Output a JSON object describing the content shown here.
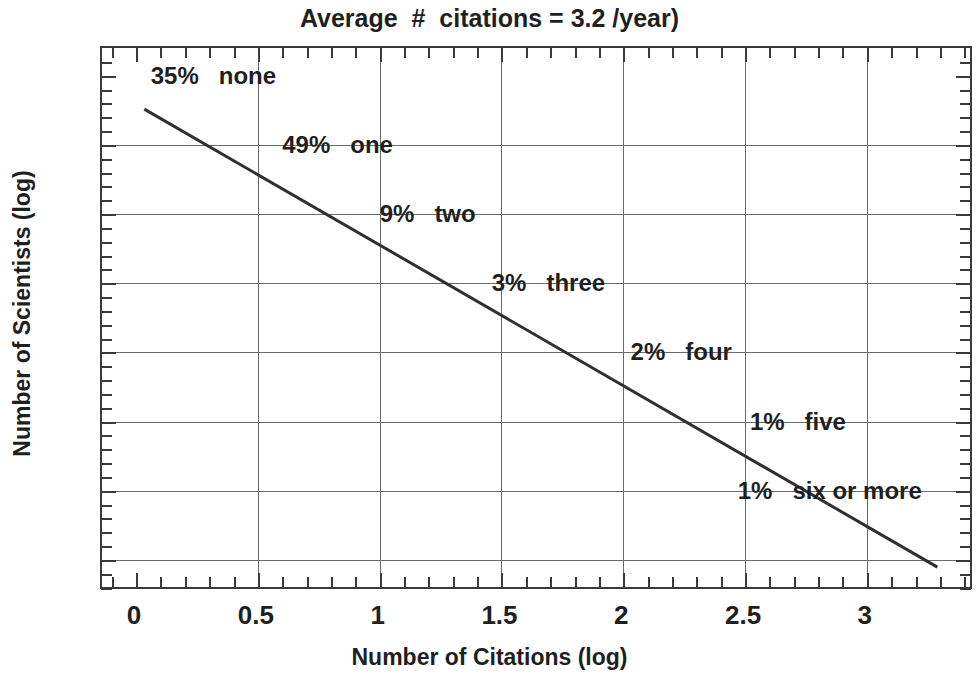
{
  "chart_data": {
    "type": "line",
    "title": "Average  #  citations = 3.2 /year)",
    "xlabel": "Number of Citations (log)",
    "ylabel": "Number of Scientists (log)",
    "xlim": [
      -0.14,
      3.44
    ],
    "ylim": [
      -8.45,
      -0.6
    ],
    "xticks": [
      "0",
      "0.5",
      "1",
      "1.5",
      "2",
      "2.5",
      "3"
    ],
    "xtick_values": [
      0,
      0.5,
      1,
      1.5,
      2,
      2.5,
      3
    ],
    "yticks": [
      "- 1",
      "- 2",
      "- 3",
      "- 4",
      "- 5",
      "- 5",
      "- 7",
      "- 8"
    ],
    "ytick_values": [
      -1,
      -2,
      -3,
      -4,
      -5,
      -6,
      -7,
      -8
    ],
    "grid": true,
    "legend": "none",
    "series": [
      {
        "name": "fitted regression line",
        "x": [
          0.04,
          3.3
        ],
        "y": [
          -1.5,
          -8.15
        ]
      }
    ],
    "annotations": [
      {
        "percent": "35%",
        "label": "none",
        "x": 0.06,
        "y": -1.0
      },
      {
        "percent": "49%",
        "label": "one",
        "x": 0.6,
        "y": -2.0
      },
      {
        "percent": "9%",
        "label": "two",
        "x": 1.0,
        "y": -3.0
      },
      {
        "percent": "3%",
        "label": "three",
        "x": 1.46,
        "y": -4.0
      },
      {
        "percent": "2%",
        "label": "four",
        "x": 2.03,
        "y": -5.0
      },
      {
        "percent": "1%",
        "label": "five",
        "x": 2.52,
        "y": -6.0
      },
      {
        "percent": "1%",
        "label": "six or more",
        "x": 2.47,
        "y": -7.0
      }
    ],
    "line_color": "#2f2f2f",
    "grid_color": "#6b6b6b",
    "axis_color": "#3a3a3a",
    "text_color": "#1f1f1f",
    "background_color": "#ffffff"
  }
}
